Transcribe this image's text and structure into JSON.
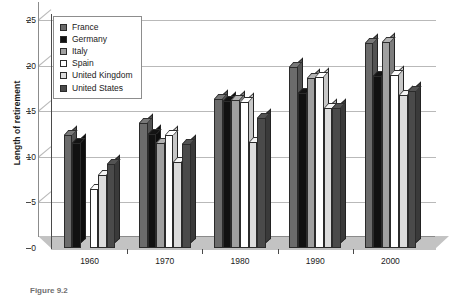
{
  "chart_data": {
    "type": "bar",
    "title": "",
    "xlabel": "",
    "ylabel": "Length of retirement",
    "ylim": [
      0,
      25
    ],
    "yticks": [
      0,
      5,
      10,
      15,
      20,
      25
    ],
    "categories": [
      "1960",
      "1970",
      "1980",
      "1990",
      "2000"
    ],
    "grid": true,
    "legend_position": "top-left",
    "series": [
      {
        "name": "France",
        "color": "#6b6b6b",
        "values": [
          12.4,
          13.7,
          16.3,
          19.9,
          22.5
        ]
      },
      {
        "name": "Germany",
        "color": "#111111",
        "values": [
          11.5,
          12.5,
          16.1,
          17.0,
          18.9
        ]
      },
      {
        "name": "Italy",
        "color": "#a0a0a0",
        "values": [
          null,
          11.5,
          16.2,
          18.6,
          22.6
        ]
      },
      {
        "name": "Spain",
        "color": "#ffffff",
        "values": [
          6.5,
          12.4,
          16.0,
          18.8,
          19.0
        ]
      },
      {
        "name": "United Kingdom",
        "color": "#dcdcdc",
        "values": [
          8.0,
          9.4,
          11.6,
          15.4,
          16.8
        ]
      },
      {
        "name": "United States",
        "color": "#4a4a4a",
        "values": [
          9.2,
          11.4,
          14.3,
          15.3,
          17.2
        ]
      }
    ]
  },
  "caption": "Figure 9.2",
  "axis": {
    "y_title": "Length of retirement"
  }
}
